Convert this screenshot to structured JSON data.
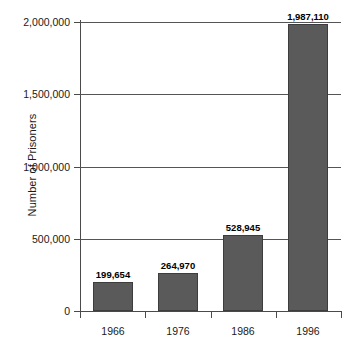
{
  "chart_data": {
    "type": "bar",
    "title": "",
    "subtitle": "",
    "xlabel": "",
    "ylabel": "Number of Prisoners",
    "categories": [
      "1966",
      "1976",
      "1986",
      "1996"
    ],
    "values": [
      199654,
      264970,
      528945,
      1987110
    ],
    "value_labels": [
      "199,654",
      "264,970",
      "528,945",
      "1,987,110"
    ],
    "series": [
      {
        "name": "Number of Prisoners",
        "values": [
          199654,
          264970,
          528945,
          1987110
        ]
      }
    ],
    "ylim": [
      0,
      2000000
    ],
    "ytick_values": [
      0,
      500000,
      1000000,
      1500000,
      2000000
    ],
    "ytick_labels": [
      "0",
      "500,000",
      "1,000,000",
      "1,500,000",
      "2,000,000"
    ],
    "grid": true,
    "grid_axis": "y",
    "legend": false,
    "legend_position": "none",
    "bar_color": "#5a5a5a",
    "bar_edge_color": "#3d3d3d",
    "background_color": "#ffffff",
    "axis_color": "#4a4a4a",
    "text_color": "#1a1a1a",
    "data_labels_shown": true,
    "data_label_weight": "bold"
  }
}
